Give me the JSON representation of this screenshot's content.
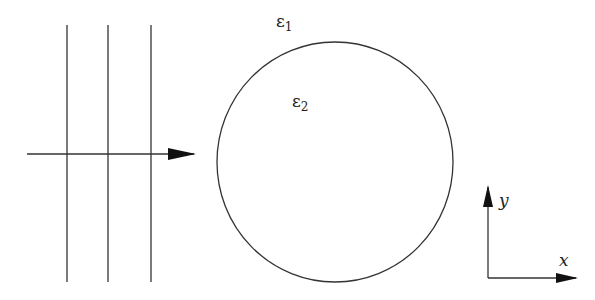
{
  "diagram": {
    "labels": {
      "eps_outer": "ε",
      "eps_outer_sub": "1",
      "eps_inner": "ε",
      "eps_inner_sub": "2",
      "axis_x": "x",
      "axis_y": "y"
    },
    "wavefronts": {
      "count": 3,
      "x": [
        67,
        108,
        151
      ],
      "y_top": 25,
      "y_bottom": 282
    },
    "incident_arrow": {
      "x1": 27,
      "x2": 193,
      "y": 154
    },
    "cylinder": {
      "cx": 335,
      "cy": 162,
      "rx": 118,
      "ry": 120
    },
    "axes": {
      "origin_x": 488,
      "origin_y": 278,
      "x_end": 575,
      "y_end": 188
    },
    "colors": {
      "stroke": "#333333",
      "background": "#ffffff"
    }
  }
}
